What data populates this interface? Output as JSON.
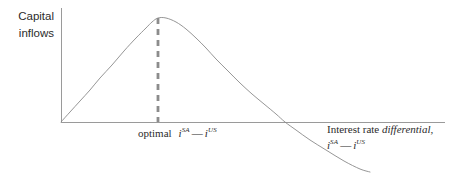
{
  "figure": {
    "width": 460,
    "height": 178,
    "background": "#ffffff"
  },
  "axes": {
    "y_label_line1": "Capital",
    "y_label_line2": "inflows",
    "x_label_line1_plain": "Interest rate ",
    "x_label_line1_italic": "differential",
    "x_label_line1_tail": ",",
    "x_label_expr_var1": "i",
    "x_label_expr_sup1": "SA",
    "x_label_expr_minus": "—",
    "x_label_expr_var2": "i",
    "x_label_expr_sup2": "US",
    "axis_color": "#9a9a9a",
    "origin_x": 61,
    "origin_y": 122,
    "x_axis_end_x": 445,
    "y_axis_top_y": 8
  },
  "annotations": {
    "optimal_word": "optimal",
    "optimal_expr_var1": "i",
    "optimal_expr_sup1": "SA",
    "optimal_expr_minus": "—",
    "optimal_expr_var2": "i",
    "optimal_expr_sup2": "US",
    "dashed_line_x": 158,
    "dashed_line_color": "#8c8c8c"
  },
  "chart_data": {
    "type": "line",
    "title": "",
    "xlabel": "Interest rate differential, i^SA — i^US",
    "ylabel": "Capital inflows",
    "grid": false,
    "legend": null,
    "axis_ranges": {
      "x": [
        0,
        1
      ],
      "y": [
        -0.52,
        1.05
      ]
    },
    "series": [
      {
        "name": "Capital inflows curve",
        "color": "#8a8a8a",
        "comment": "Inverted-U: rises from origin to a maximum at the optimal differential, then falls and turns negative.",
        "points_px": [
          [
            61,
            122
          ],
          [
            70,
            112
          ],
          [
            80,
            101
          ],
          [
            90,
            90
          ],
          [
            100,
            78
          ],
          [
            112,
            65
          ],
          [
            124,
            51
          ],
          [
            136,
            38
          ],
          [
            146,
            28
          ],
          [
            152,
            22
          ],
          [
            158,
            18
          ],
          [
            166,
            18
          ],
          [
            176,
            22
          ],
          [
            186,
            29
          ],
          [
            196,
            38
          ],
          [
            206,
            48
          ],
          [
            216,
            59
          ],
          [
            228,
            71
          ],
          [
            240,
            83
          ],
          [
            252,
            94
          ],
          [
            264,
            104
          ],
          [
            276,
            114
          ],
          [
            285,
            122
          ],
          [
            296,
            130
          ],
          [
            310,
            140
          ],
          [
            326,
            150
          ],
          [
            344,
            161
          ],
          [
            360,
            169
          ],
          [
            370,
            172
          ]
        ],
        "x_values": [
          0.0,
          0.03,
          0.06,
          0.1,
          0.13,
          0.16,
          0.2,
          0.23,
          0.26,
          0.29,
          0.32,
          0.35,
          0.38,
          0.41,
          0.44,
          0.47,
          0.5,
          0.54,
          0.57,
          0.61,
          0.64,
          0.68,
          0.72,
          0.77,
          0.82,
          0.87,
          0.93,
          0.97,
          1.0
        ],
        "y_values": [
          0.0,
          0.1,
          0.2,
          0.3,
          0.41,
          0.53,
          0.66,
          0.78,
          0.87,
          0.93,
          1.0,
          1.0,
          0.96,
          0.9,
          0.82,
          0.73,
          0.63,
          0.52,
          0.4,
          0.29,
          0.18,
          0.08,
          0.0,
          -0.08,
          -0.18,
          -0.28,
          -0.39,
          -0.47,
          -0.5
        ]
      }
    ],
    "markers": [
      {
        "name": "optimal-differential",
        "kind": "vertical-dashed-line",
        "x_px": 158,
        "from_y_px": 18,
        "to_y_px": 122,
        "label": "optimal i^SA — i^US"
      }
    ],
    "peak": {
      "x_px": 158,
      "y_px": 18,
      "label": "maximum capital inflows"
    },
    "x_axis_crossing_px": 285
  }
}
